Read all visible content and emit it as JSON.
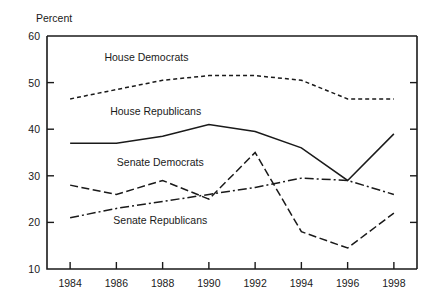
{
  "chart_data": {
    "type": "line",
    "title": "",
    "xlabel": "",
    "ylabel": "Percent",
    "categories": [
      1984,
      1986,
      1988,
      1990,
      1992,
      1994,
      1996,
      1998
    ],
    "x": [
      1984,
      1986,
      1988,
      1990,
      1992,
      1994,
      1996,
      1998
    ],
    "xlim": [
      1983,
      1999
    ],
    "ylim": [
      10,
      60
    ],
    "yticks": [
      10,
      20,
      30,
      40,
      50,
      60
    ],
    "xticks": [
      1984,
      1986,
      1988,
      1990,
      1992,
      1994,
      1996,
      1998
    ],
    "ytick_labels": [
      "10",
      "20",
      "30",
      "40",
      "50",
      "60"
    ],
    "xtick_labels": [
      "1984",
      "1986",
      "1988",
      "1990",
      "1992",
      "1994",
      "1996",
      "1998"
    ],
    "grid": false,
    "legend": "inline-labels",
    "series": [
      {
        "name": "House Democrats",
        "dash": "4,3",
        "color": "#1a1a1a",
        "values": [
          46.5,
          48.5,
          50.5,
          51.5,
          51.5,
          50.5,
          46.5,
          46.5
        ],
        "label_x": 1987.3,
        "label_y": 55.5
      },
      {
        "name": "House Republicans",
        "dash": "none",
        "color": "#1a1a1a",
        "values": [
          37.0,
          37.0,
          38.5,
          41.0,
          39.5,
          36.0,
          29.0,
          39.0
        ],
        "label_x": 1987.7,
        "label_y": 44.0
      },
      {
        "name": "Senate Democrats",
        "dash": "8,3.5",
        "color": "#1a1a1a",
        "values": [
          28.0,
          26.0,
          29.0,
          25.0,
          35.0,
          18.0,
          14.5,
          22.0
        ],
        "label_x": 1987.9,
        "label_y": 33.0
      },
      {
        "name": "Senate Republicans",
        "dash": "9,3,2,3",
        "color": "#1a1a1a",
        "values": [
          21.0,
          23.0,
          24.5,
          26.0,
          27.5,
          29.5,
          29.0,
          26.0
        ],
        "label_x": 1987.9,
        "label_y": 20.5
      }
    ]
  },
  "axis": {
    "y_title": "Percent"
  }
}
